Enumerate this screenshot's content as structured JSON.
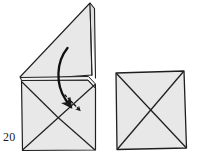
{
  "figure": {
    "step_number": "20",
    "background_color": "#ffffff",
    "paper_fill": "#e6e6e6",
    "paper_fill_light": "#efefef",
    "line_color": "#1a1a1a",
    "panels": [
      {
        "name": "before-fold",
        "description": "Square base with raised triangular flap standing up, curved fold arrow and dashed motion arrow",
        "shapes": [
          {
            "name": "standing-triangle-flap",
            "type": "polygon",
            "points": "20,77 90,3 92,75 22,80",
            "fill": "#e6e6e6"
          },
          {
            "name": "flap-spine",
            "type": "polyline",
            "points": "90,3 94,8 95,78",
            "fill": "none"
          },
          {
            "name": "base-square-body",
            "type": "polygon",
            "points": "21,80 88,80 95,88 95,150 22,150",
            "fill": "#e6e6e6"
          },
          {
            "name": "base-left-diagonal",
            "type": "line",
            "x1": 22,
            "y1": 150,
            "x2": 95,
            "y2": 85
          },
          {
            "name": "base-right-diagonal",
            "type": "line",
            "x1": 95,
            "y1": 150,
            "x2": 58,
            "y2": 118
          },
          {
            "name": "base-left-lower-diagonal",
            "type": "line",
            "x1": 22,
            "y1": 82,
            "x2": 58,
            "y2": 118
          },
          {
            "name": "curved-fold-arrow",
            "type": "path",
            "d": "M 67,49 C 57,60 55,82 66,100 L 72,108"
          },
          {
            "name": "dashed-motion-arrow",
            "type": "path",
            "d": "M 66,96 L 82,112"
          }
        ]
      },
      {
        "name": "after-fold",
        "description": "Flat square with both diagonals forming an X",
        "shapes": [
          {
            "name": "result-square",
            "type": "polygon",
            "points": "116,73 184,71 186,148 117,149",
            "fill": "#e6e6e6"
          },
          {
            "name": "result-diagonal-tlbr",
            "type": "line",
            "x1": 116,
            "y1": 73,
            "x2": 186,
            "y2": 148
          },
          {
            "name": "result-diagonal-trbl",
            "type": "line",
            "x1": 184,
            "y1": 71,
            "x2": 117,
            "y2": 149
          }
        ]
      }
    ]
  }
}
